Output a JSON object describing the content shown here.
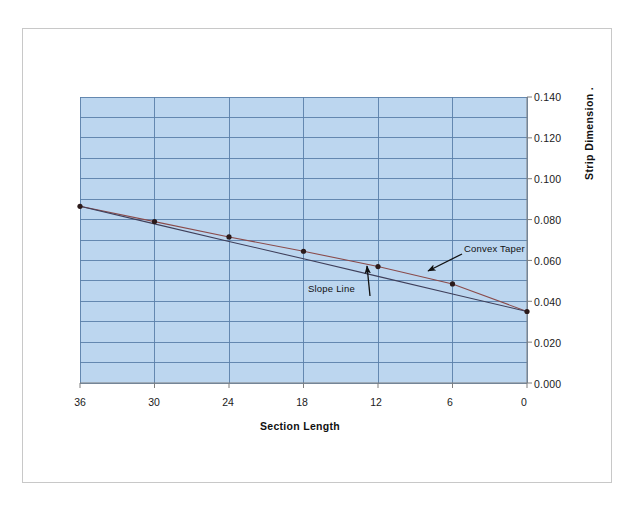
{
  "figure": {
    "background_color": "#ffffff",
    "frame_border_color": "#c8c8c8"
  },
  "axes": {
    "x_title": "Section Length",
    "y_title": "Strip Dimension .",
    "x_ticks": [
      "36",
      "30",
      "24",
      "18",
      "12",
      "6",
      "0"
    ],
    "y_ticks": [
      "0.140",
      "0.120",
      "0.100",
      "0.080",
      "0.060",
      "0.040",
      "0.020",
      "0.000"
    ]
  },
  "annotations": {
    "convex_taper": "Convex Taper",
    "slope_line": "Slope Line"
  },
  "colors": {
    "plot_background": "#bcd6ef",
    "gridline": "#5a7fa8",
    "axis_line": "#7f7f7f",
    "convex_taper_line": "#8a4b4b",
    "slope_line": "#3f3f5a",
    "marker": "#2b1a1a"
  },
  "chart_data": {
    "type": "line",
    "title": "",
    "xlabel": "Section Length",
    "ylabel": "Strip Dimension .",
    "x": [
      36,
      30,
      24,
      18,
      12,
      6,
      0
    ],
    "xlim": [
      36,
      0
    ],
    "ylim": [
      0.0,
      0.14
    ],
    "x_tick_values": [
      36,
      30,
      24,
      18,
      12,
      6,
      0
    ],
    "y_tick_values": [
      0.0,
      0.02,
      0.04,
      0.06,
      0.08,
      0.1,
      0.12,
      0.14
    ],
    "minor_y_step": 0.01,
    "grid": true,
    "legend": "none",
    "x_axis_direction": "descending",
    "series": [
      {
        "name": "Convex Taper",
        "markers": true,
        "values": [
          0.0865,
          0.079,
          0.0715,
          0.0645,
          0.057,
          0.0485,
          0.035
        ]
      },
      {
        "name": "Slope Line",
        "markers": false,
        "values": [
          0.0865,
          0.0779,
          0.0693,
          0.0608,
          0.0522,
          0.0436,
          0.035
        ]
      }
    ]
  }
}
